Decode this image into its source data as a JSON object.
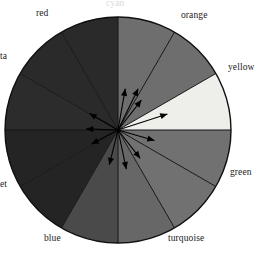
{
  "figure": {
    "background": "#ffffff",
    "width": 258,
    "height": 254
  },
  "wheel": {
    "center_x": 118,
    "center_y": 130,
    "radius": 113,
    "outline_color": "#101010",
    "divider_color": "#141414",
    "segment_count": 12
  },
  "labels": {
    "top_cut": "cyan",
    "orange": "orange",
    "yellow": "yellow",
    "green": "green",
    "turquoise": "turquoise",
    "blue": "blue",
    "violet_cut": "et",
    "magenta_cut": "ta",
    "red": "red"
  },
  "chart_data": {
    "type": "pie",
    "xlabel": "",
    "ylabel": "",
    "categories": [
      "orange",
      "yellow",
      "green",
      "turquoise",
      "blue",
      "violet",
      "magenta",
      "red",
      "cyan"
    ],
    "values": [
      30,
      30,
      30,
      30,
      30,
      30,
      30,
      30,
      30
    ],
    "legend_position": "around-perimeter",
    "grid": false,
    "segments": [
      {
        "name": "orange",
        "start_deg": -90,
        "end_deg": -60,
        "fill": "#6e6e6e"
      },
      {
        "name": "orange-2",
        "start_deg": -60,
        "end_deg": -30,
        "fill": "#6e6e6e"
      },
      {
        "name": "yellow",
        "start_deg": -30,
        "end_deg": 0,
        "fill": "#eeeeea"
      },
      {
        "name": "green",
        "start_deg": 0,
        "end_deg": 30,
        "fill": "#717171"
      },
      {
        "name": "green-2",
        "start_deg": 30,
        "end_deg": 60,
        "fill": "#717171"
      },
      {
        "name": "turquoise",
        "start_deg": 60,
        "end_deg": 90,
        "fill": "#676767"
      },
      {
        "name": "blue",
        "start_deg": 90,
        "end_deg": 120,
        "fill": "#4a4a4a"
      },
      {
        "name": "violet",
        "start_deg": 120,
        "end_deg": 150,
        "fill": "#242424"
      },
      {
        "name": "violet-2",
        "start_deg": 150,
        "end_deg": 180,
        "fill": "#242424"
      },
      {
        "name": "magenta",
        "start_deg": 180,
        "end_deg": 210,
        "fill": "#2c2c2c"
      },
      {
        "name": "red",
        "start_deg": 210,
        "end_deg": 240,
        "fill": "#2a2a2a"
      },
      {
        "name": "red-2",
        "start_deg": 240,
        "end_deg": 270,
        "fill": "#2a2a2a"
      }
    ],
    "arrows": {
      "color": "#000000",
      "origin": [
        118,
        130
      ],
      "vectors": [
        {
          "angle_deg": -80,
          "length": 42
        },
        {
          "angle_deg": -64,
          "length": 46
        },
        {
          "angle_deg": -52,
          "length": 38
        },
        {
          "angle_deg": -18,
          "length": 52
        },
        {
          "angle_deg": 16,
          "length": 38
        },
        {
          "angle_deg": 52,
          "length": 36
        },
        {
          "angle_deg": 78,
          "length": 40
        },
        {
          "angle_deg": 104,
          "length": 36
        },
        {
          "angle_deg": 152,
          "length": 30
        },
        {
          "angle_deg": 182,
          "length": 32
        },
        {
          "angle_deg": 210,
          "length": 33
        }
      ]
    }
  }
}
